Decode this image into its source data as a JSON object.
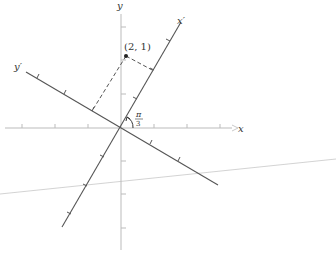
{
  "diagram": {
    "axes": {
      "x_label": "x",
      "y_label": "y",
      "x_prime_label": "x′",
      "y_prime_label": "y′"
    },
    "point": {
      "label": "(2, 1)",
      "coords": [
        2,
        1
      ]
    },
    "angle": {
      "numerator": "π",
      "denominator": "3",
      "value": "π/3"
    },
    "colors": {
      "axis": "#bbbbbb",
      "rotated_axis": "#555555",
      "text": "#333333"
    }
  }
}
